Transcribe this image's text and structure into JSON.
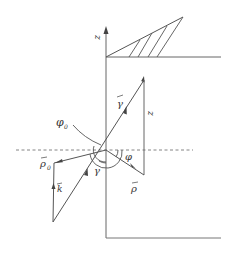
{
  "diagram": {
    "type": "vector-geometry",
    "colors": {
      "line": "#555555",
      "dashed": "#777777",
      "text": "#333333",
      "background": "#ffffff"
    },
    "labels": {
      "z_axis": "z",
      "gamma_vec": "γ",
      "z_vec": "z",
      "phi0": "φ",
      "phi0_sub": "0",
      "phi": "φ",
      "rho0_vec": "ρ",
      "rho0_sub": "0",
      "rho_vec": "ρ",
      "k_vec": "k",
      "gamma_angle": "γ"
    },
    "vectors": [
      {
        "name": "gamma",
        "from": [
          53,
          222
        ],
        "to": [
          144,
          80
        ]
      },
      {
        "name": "z",
        "from": [
          144,
          175
        ],
        "to": [
          144,
          80
        ]
      },
      {
        "name": "rho",
        "from": [
          106,
          150
        ],
        "to": [
          144,
          175
        ]
      },
      {
        "name": "rho0",
        "from": [
          106,
          150
        ],
        "to": [
          54,
          163
        ]
      },
      {
        "name": "k",
        "from": [
          53,
          222
        ],
        "to": [
          54,
          163
        ]
      }
    ]
  }
}
